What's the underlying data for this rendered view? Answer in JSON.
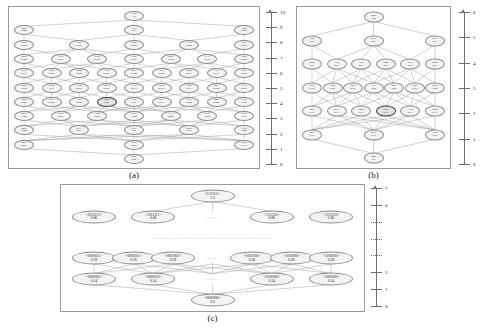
{
  "figure": {
    "panels": [
      {
        "id": "a",
        "caption": "(a)",
        "axis": {
          "min": 0,
          "max": 10,
          "ticks": [
            0,
            1,
            2,
            3,
            4,
            5,
            6,
            7,
            8,
            9,
            10
          ],
          "dotted_ticks": []
        },
        "levels": [
          {
            "rank": 10,
            "nodes": [
              {
                "label": "<345>",
                "value": "1.0"
              }
            ]
          },
          {
            "rank": 9,
            "nodes": [
              {
                "label": "<045>",
                "value": "0.842"
              },
              {
                "label": "<135>",
                "value": "0.911"
              },
              {
                "label": "<144>",
                "value": "0.905"
              }
            ]
          },
          {
            "rank": 8,
            "nodes": [
              {
                "label": "<035>",
                "value": "0.848"
              },
              {
                "label": "<125>",
                "value": "0.841"
              },
              {
                "label": "<044>",
                "value": "0.800"
              },
              {
                "label": "<134>",
                "value": "0.850"
              },
              {
                "label": "<143>",
                "value": "0.867"
              }
            ]
          },
          {
            "rank": 7,
            "nodes": [
              {
                "label": "<025>",
                "value": "0.788"
              },
              {
                "label": "<115>",
                "value": "0.791"
              },
              {
                "label": "<034>",
                "value": "0.757"
              },
              {
                "label": "<124>",
                "value": "0.797"
              },
              {
                "label": "<043>",
                "value": "0.762"
              },
              {
                "label": "<133>",
                "value": "0.793"
              },
              {
                "label": "<142>",
                "value": "0.808"
              }
            ]
          },
          {
            "rank": 6,
            "nodes": [
              {
                "label": "<015>",
                "value": "0.717"
              },
              {
                "label": "<105>",
                "value": "0.747"
              },
              {
                "label": "<024>",
                "value": "0.695"
              },
              {
                "label": "<114>",
                "value": "0.686"
              },
              {
                "label": "<033>",
                "value": "0.700"
              },
              {
                "label": "<123>",
                "value": "0.700"
              },
              {
                "label": "<042>",
                "value": "0.667"
              },
              {
                "label": "<132>",
                "value": "0.733"
              },
              {
                "label": "<141>",
                "value": "0.750"
              }
            ]
          },
          {
            "rank": 5,
            "nodes": [
              {
                "label": "<005>",
                "value": "0.659"
              },
              {
                "label": "<014>",
                "value": "0.61"
              },
              {
                "label": "<104>",
                "value": "0.647"
              },
              {
                "label": "<023>",
                "value": "0.587"
              },
              {
                "label": "<113>",
                "value": "0.617"
              },
              {
                "label": "<032>",
                "value": "0.583"
              },
              {
                "label": "<122>",
                "value": "0.633"
              },
              {
                "label": "<041>",
                "value": "0.600"
              },
              {
                "label": "<131>",
                "value": "0.667"
              }
            ]
          },
          {
            "rank": 4,
            "nodes": [
              {
                "label": "<004>",
                "value": "0.567"
              },
              {
                "label": "<013>",
                "value": "0.500"
              },
              {
                "label": "<103>",
                "value": "0.540"
              },
              {
                "label": "<022>",
                "value": "0.50",
                "highlight": true
              },
              {
                "label": "<112>",
                "value": "0.53"
              },
              {
                "label": "<031>",
                "value": "0.517"
              },
              {
                "label": "<121>",
                "value": "0.562"
              },
              {
                "label": "<040>",
                "value": "0.500"
              },
              {
                "label": "<130>",
                "value": "0.50"
              }
            ]
          },
          {
            "rank": 3,
            "nodes": [
              {
                "label": "<003>",
                "value": "0.40"
              },
              {
                "label": "<012>",
                "value": "0.416"
              },
              {
                "label": "<102>",
                "value": "0.467"
              },
              {
                "label": "<021>",
                "value": "1.200"
              },
              {
                "label": "<111>",
                "value": "0.403"
              },
              {
                "label": "<030>",
                "value": "0.20"
              },
              {
                "label": "<120>",
                "value": "0.38"
              }
            ]
          },
          {
            "rank": 2,
            "nodes": [
              {
                "label": "<002>",
                "value": "0.200"
              },
              {
                "label": "<011>",
                "value": "0.21"
              },
              {
                "label": "<101>",
                "value": "0.4"
              },
              {
                "label": "<020>",
                "value": "0.167"
              },
              {
                "label": "<110>",
                "value": "0.42"
              }
            ]
          },
          {
            "rank": 1,
            "nodes": [
              {
                "label": "<001>",
                "value": "0.097"
              },
              {
                "label": "<010>",
                "value": "0.061"
              },
              {
                "label": "<100>",
                "value": "0.133"
              }
            ]
          },
          {
            "rank": 0,
            "nodes": [
              {
                "label": "<000>",
                "value": "0.00"
              }
            ]
          }
        ]
      },
      {
        "id": "b",
        "caption": "(b)",
        "axis": {
          "min": 0,
          "max": 6,
          "ticks": [
            0,
            1,
            2,
            3,
            4,
            5,
            6
          ],
          "dotted_ticks": []
        },
        "levels": [
          {
            "rank": 6,
            "nodes": [
              {
                "label": "<222>",
                "value": "1.00"
              }
            ]
          },
          {
            "rank": 5,
            "nodes": [
              {
                "label": "<122>",
                "value": "0.83"
              },
              {
                "label": "<212>",
                "value": "0.83"
              },
              {
                "label": "<221>",
                "value": "0.83"
              }
            ]
          },
          {
            "rank": 4,
            "nodes": [
              {
                "label": "<022>",
                "value": "0.67"
              },
              {
                "label": "<112>",
                "value": "0.67"
              },
              {
                "label": "<121>",
                "value": "0.67"
              },
              {
                "label": "<202>",
                "value": "0.67"
              },
              {
                "label": "<211>",
                "value": "0.67"
              },
              {
                "label": "<220>",
                "value": "0.67"
              }
            ]
          },
          {
            "rank": 3,
            "nodes": [
              {
                "label": "<012>",
                "value": "0.50"
              },
              {
                "label": "<102>",
                "value": "0.50"
              },
              {
                "label": "<021>",
                "value": "0.50"
              },
              {
                "label": "<111>",
                "value": "0.50"
              },
              {
                "label": "<201>",
                "value": "0.50"
              },
              {
                "label": "<120>",
                "value": "0.50"
              },
              {
                "label": "<210>",
                "value": "0.50"
              }
            ]
          },
          {
            "rank": 2,
            "nodes": [
              {
                "label": "<002>",
                "value": "0.33"
              },
              {
                "label": "<011>",
                "value": "0.33"
              },
              {
                "label": "<020>",
                "value": "0.33"
              },
              {
                "label": "<101>",
                "value": "0.33",
                "highlight": true
              },
              {
                "label": "<110>",
                "value": "0.33"
              },
              {
                "label": "<200>",
                "value": "0.33"
              }
            ]
          },
          {
            "rank": 1,
            "nodes": [
              {
                "label": "<001>",
                "value": "0.16"
              },
              {
                "label": "<010>",
                "value": "0.16"
              },
              {
                "label": "<100>",
                "value": "0.16"
              }
            ]
          },
          {
            "rank": 0,
            "nodes": [
              {
                "label": "<000>",
                "value": "0.0"
              }
            ]
          }
        ]
      },
      {
        "id": "c",
        "caption": "(c)",
        "axis": {
          "min": 0,
          "max": 7,
          "ticks": [
            0,
            1,
            2,
            6,
            7
          ],
          "dotted_ticks": [
            3,
            4,
            5
          ]
        },
        "levels": [
          {
            "rank": 7,
            "nodes": [
              {
                "label": "<1111111>",
                "value": "1.0"
              }
            ]
          },
          {
            "rank": 6,
            "nodes": [
              {
                "label": "<0111111>",
                "value": "0.86"
              },
              {
                "label": "<1011111>",
                "value": "0.86"
              },
              {
                "label": "ellipsis"
              },
              {
                "label": "<1111101>",
                "value": "0.86"
              },
              {
                "label": "<1111110>",
                "value": "0.86"
              }
            ]
          },
          {
            "rank": "mid",
            "ellipsis_row": "······  ······  ······  ······  ······  ······  ······  ······  ······"
          },
          {
            "rank": 2,
            "nodes": [
              {
                "label": "<0000011>",
                "value": "0.28"
              },
              {
                "label": "<0000101>",
                "value": "0.28"
              },
              {
                "label": "<0001001>",
                "value": "0.28"
              },
              {
                "label": "ellipsis"
              },
              {
                "label": "<0101000>",
                "value": "0.28"
              },
              {
                "label": "<1010000>",
                "value": "0.28"
              },
              {
                "label": "<1100000>",
                "value": "0.28"
              }
            ]
          },
          {
            "rank": 1,
            "nodes": [
              {
                "label": "<0000001>",
                "value": "0.14"
              },
              {
                "label": "<0000010>",
                "value": "0.14"
              },
              {
                "label": "ellipsis"
              },
              {
                "label": "<0100000>",
                "value": "0.14"
              },
              {
                "label": "<1000000>",
                "value": "0.14"
              }
            ]
          },
          {
            "rank": 0,
            "nodes": [
              {
                "label": "<0000000>",
                "value": "0.0"
              }
            ]
          }
        ]
      }
    ]
  },
  "chart_data": {
    "type": "diagram",
    "title": "",
    "panels": [
      {
        "id": "a",
        "caption": "(a)",
        "alphabet_size": 6,
        "word_length": 3,
        "axis_label": "rank",
        "ylim": [
          0,
          10
        ],
        "node_count": 66
      },
      {
        "id": "b",
        "caption": "(b)",
        "alphabet_size": 3,
        "word_length": 3,
        "axis_label": "rank",
        "ylim": [
          0,
          6
        ],
        "node_count": 27
      },
      {
        "id": "c",
        "caption": "(c)",
        "alphabet_size": 2,
        "word_length": 7,
        "axis_label": "rank",
        "ylim": [
          0,
          7
        ],
        "node_count": 128
      }
    ]
  }
}
